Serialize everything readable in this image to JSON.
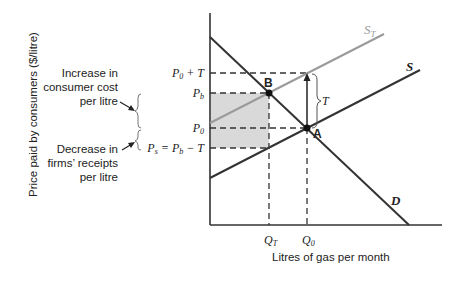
{
  "diagram": {
    "title": "",
    "y_axis_label": "Price paid by consumers ($/litre)",
    "x_axis_label": "Litres of gas per month",
    "curves": {
      "demand": {
        "label": "D",
        "color": "#333333"
      },
      "supply": {
        "label": "S",
        "color": "#333333"
      },
      "supply_tax": {
        "label": "S",
        "subscript": "T",
        "color": "#9a9a9a"
      }
    },
    "points": {
      "a": {
        "label": "A"
      },
      "b": {
        "label": "B"
      }
    },
    "price_levels": {
      "p0_plus_t": {
        "main": "P",
        "sub": "0",
        "suffix": " + T"
      },
      "pb": {
        "main": "P",
        "sub": "b"
      },
      "p0": {
        "main": "P",
        "sub": "0"
      },
      "ps": {
        "main": "P",
        "sub": "s",
        "mid": " = P",
        "sub2": "b",
        "suffix": " − T"
      }
    },
    "quantities": {
      "qt": {
        "main": "Q",
        "sub": "T"
      },
      "q0": {
        "main": "Q",
        "sub": "0"
      }
    },
    "tax_bracket_label": "T",
    "annotations": {
      "increase": [
        "Increase in",
        "consumer cost",
        "per litre"
      ],
      "decrease": [
        "Decrease in",
        "firms’ receipts",
        "per litre"
      ]
    },
    "shaded_color": "#d9d9d9"
  }
}
